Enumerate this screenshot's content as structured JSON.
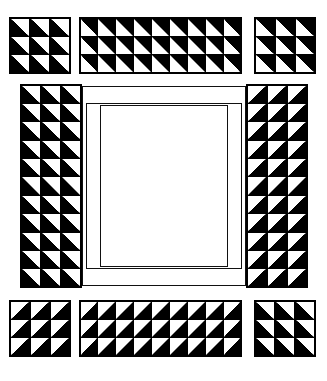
{
  "diagram": {
    "title": "Pieced Border Quilt Layout",
    "background_color": "#ffffff",
    "ink_color": "#000000",
    "canvas": {
      "width": 327,
      "height": 381
    }
  },
  "legend": {
    "unit_name": "half-square triangle",
    "unit_colors": [
      "#000000",
      "#ffffff"
    ]
  },
  "detached_units": {
    "top_left_corner": {
      "label": "top-left corner block",
      "columns": 3,
      "rows": 3,
      "orientation": "black-upper-left",
      "x": 9,
      "y": 17,
      "width": 62,
      "height": 57
    },
    "top_border_strip": {
      "label": "top border strip",
      "columns": 9,
      "rows": 3,
      "orientation": "white-upper-left",
      "x": 79,
      "y": 17,
      "width": 163,
      "height": 57
    },
    "top_right_corner": {
      "label": "top-right corner block",
      "columns": 3,
      "rows": 3,
      "orientation": "white-upper-left",
      "x": 254,
      "y": 17,
      "width": 62,
      "height": 57
    },
    "bottom_left_corner": {
      "label": "bottom-left corner block",
      "columns": 3,
      "rows": 3,
      "orientation": "black-upper-right",
      "x": 9,
      "y": 300,
      "width": 62,
      "height": 57
    },
    "bottom_border_strip": {
      "label": "bottom border strip",
      "columns": 9,
      "rows": 3,
      "orientation": "black-upper-right",
      "x": 79,
      "y": 300,
      "width": 163,
      "height": 57
    },
    "bottom_right_corner": {
      "label": "bottom-right corner block",
      "columns": 3,
      "rows": 3,
      "orientation": "white-lower-left",
      "x": 254,
      "y": 300,
      "width": 62,
      "height": 57
    }
  },
  "assembly": {
    "frame": {
      "label": "assembled quilt frame",
      "x": 20,
      "y": 84,
      "width": 288,
      "height": 204
    },
    "left_border_panel": {
      "label": "left pieced border panel",
      "columns": 3,
      "rows": 11,
      "orientation": "black-upper-left",
      "x": 20,
      "y": 84,
      "width": 62,
      "height": 204
    },
    "right_border_panel": {
      "label": "right pieced border panel",
      "columns": 3,
      "rows": 11,
      "orientation": "black-upper-right",
      "x": 246,
      "y": 84,
      "width": 62,
      "height": 204
    },
    "center_frame": {
      "label": "plain sashing frame",
      "x": 82,
      "y": 86,
      "width": 164,
      "height": 200
    },
    "inner_sashing": {
      "label": "inner sashing rectangle",
      "x": 86,
      "y": 103,
      "width": 156,
      "height": 166
    },
    "quilt_center": {
      "label": "plain quilt center",
      "x": 100,
      "y": 105,
      "width": 128,
      "height": 162
    }
  },
  "counts": {
    "corner_blocks": 4,
    "border_strips": 2,
    "side_panels": 2,
    "units_per_corner": 9,
    "units_per_strip": 27,
    "units_per_side_panel": 33
  }
}
